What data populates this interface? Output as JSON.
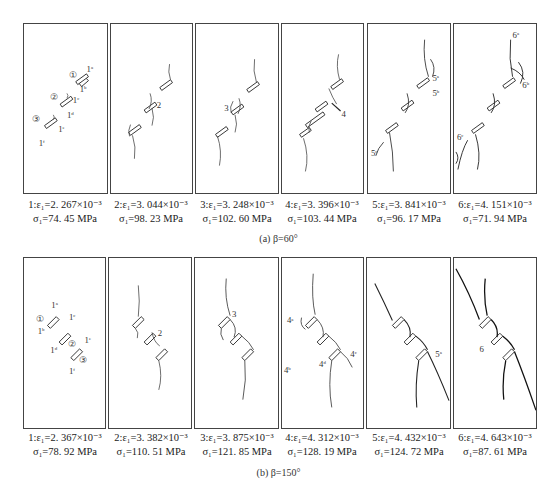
{
  "figure": {
    "rows": [
      {
        "subcaption": "(a)  β=60°",
        "panels": [
          {
            "index": "1",
            "strain_label": "1:ε₁=2. 267×10⁻³",
            "stress_label": "σ₁=74. 45 MPa",
            "strain": "2.267×10^-3",
            "stress_mpa": 74.45,
            "annotations": [
              "①",
              "②",
              "③",
              "1ᵃ",
              "1ᵇ",
              "1ᶜ",
              "1ᵈ",
              "1ᵉ",
              "1ᶠ"
            ]
          },
          {
            "index": "2",
            "strain_label": "2:ε₁=3. 044×10⁻³",
            "stress_label": "σ₁=98. 23 MPa",
            "strain": "3.044×10^-3",
            "stress_mpa": 98.23,
            "annotations": [
              "2"
            ]
          },
          {
            "index": "3",
            "strain_label": "3:ε₁=3. 248×10⁻³",
            "stress_label": "σ₁=102. 60 MPa",
            "strain": "3.248×10^-3",
            "stress_mpa": 102.6,
            "annotations": [
              "3"
            ]
          },
          {
            "index": "4",
            "strain_label": "4:ε₁=3. 396×10⁻³",
            "stress_label": "σ₁=103. 44 MPa",
            "strain": "3.396×10^-3",
            "stress_mpa": 103.44,
            "annotations": [
              "4"
            ]
          },
          {
            "index": "5",
            "strain_label": "5:ε₁=3. 841×10⁻³",
            "stress_label": "σ₁=96. 17 MPa",
            "strain": "3.841×10^-3",
            "stress_mpa": 96.17,
            "annotations": [
              "5ᵃ",
              "5ᵇ",
              "5ᶜ"
            ]
          },
          {
            "index": "6",
            "strain_label": "6:ε₁=4. 151×10⁻³",
            "stress_label": "σ₁=71. 94 MPa",
            "strain": "4.151×10^-3",
            "stress_mpa": 71.94,
            "annotations": [
              "6ᵃ",
              "6ᵇ",
              "6ᶜ"
            ]
          }
        ]
      },
      {
        "subcaption": "(b)  β=150°",
        "panels": [
          {
            "index": "1",
            "strain_label": "1:ε₁=2. 367×10⁻³",
            "stress_label": "σ₁=78. 92 MPa",
            "strain": "2.367×10^-3",
            "stress_mpa": 78.92,
            "annotations": [
              "①",
              "②",
              "③",
              "1ᵃ",
              "1ᵇ",
              "1ᶜ",
              "1ᵈ",
              "1ᵉ",
              "1ᶠ"
            ]
          },
          {
            "index": "2",
            "strain_label": "2:ε₁=3. 382×10⁻³",
            "stress_label": "σ₁=110. 51 MPa",
            "strain": "3.382×10^-3",
            "stress_mpa": 110.51,
            "annotations": [
              "2"
            ]
          },
          {
            "index": "3",
            "strain_label": "3:ε₁=3. 875×10⁻³",
            "stress_label": "σ₁=121. 85 MPa",
            "strain": "3.875×10^-3",
            "stress_mpa": 121.85,
            "annotations": [
              "3"
            ]
          },
          {
            "index": "4",
            "strain_label": "4:ε₁=4. 312×10⁻³",
            "stress_label": "σ₁=128. 19 MPa",
            "strain": "4.312×10^-3",
            "stress_mpa": 128.19,
            "annotations": [
              "4ᵃ",
              "4ᵇ",
              "4ᶜ",
              "4ᵈ"
            ]
          },
          {
            "index": "5",
            "strain_label": "5:ε₁=4. 432×10⁻³",
            "stress_label": "σ₁=124. 72 MPa",
            "strain": "4.432×10^-3",
            "stress_mpa": 124.72,
            "annotations": [
              "5ᵃ"
            ]
          },
          {
            "index": "6",
            "strain_label": "6:ε₁=4. 643×10⁻³",
            "stress_label": "σ₁=87. 61 MPa",
            "strain": "4.643×10^-3",
            "stress_mpa": 87.61,
            "annotations": [
              "6"
            ]
          }
        ]
      }
    ],
    "labels": {
      "c1": "①",
      "c2": "②",
      "c3": "③",
      "a": "1",
      "sa": "a",
      "sb": "b",
      "sc": "c",
      "sd": "d",
      "se": "e",
      "sf": "f",
      "n2": "2",
      "n3": "3",
      "n4": "4",
      "n5": "5",
      "n6": "6"
    }
  }
}
